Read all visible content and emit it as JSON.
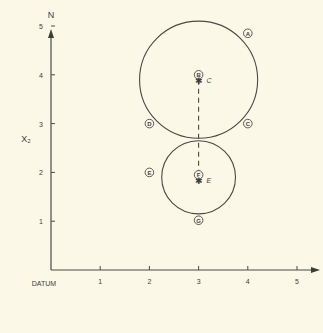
{
  "diagram": {
    "y_axis_label": "N",
    "x_side_label": "X₂",
    "origin_label": "DATUM",
    "x_ticks": [
      "1",
      "2",
      "3",
      "4",
      "5"
    ],
    "y_ticks": [
      "1",
      "2",
      "3",
      "4",
      "5"
    ],
    "circles": [
      {
        "name": "upper",
        "center_x": 3,
        "center_y": 3.9,
        "radius": 1.2
      },
      {
        "name": "lower",
        "center_x": 3,
        "center_y": 1.9,
        "radius": 0.75
      }
    ],
    "center_labels": [
      {
        "marker": "B",
        "letter": "C",
        "x": 3,
        "y": 4.0
      },
      {
        "marker": "F",
        "letter": "E",
        "x": 3,
        "y": 1.95
      }
    ],
    "point_markers": [
      {
        "marker": "A",
        "x": 4.0,
        "y": 4.85
      },
      {
        "marker": "D",
        "x": 2.0,
        "y": 3.0
      },
      {
        "marker": "C",
        "x": 4.0,
        "y": 3.0
      },
      {
        "marker": "E",
        "x": 2.0,
        "y": 2.0
      },
      {
        "marker": "G",
        "x": 3.0,
        "y": 1.02
      }
    ],
    "colors": {
      "ink": "#4a4a44",
      "paper": "#fbf8e8"
    }
  }
}
